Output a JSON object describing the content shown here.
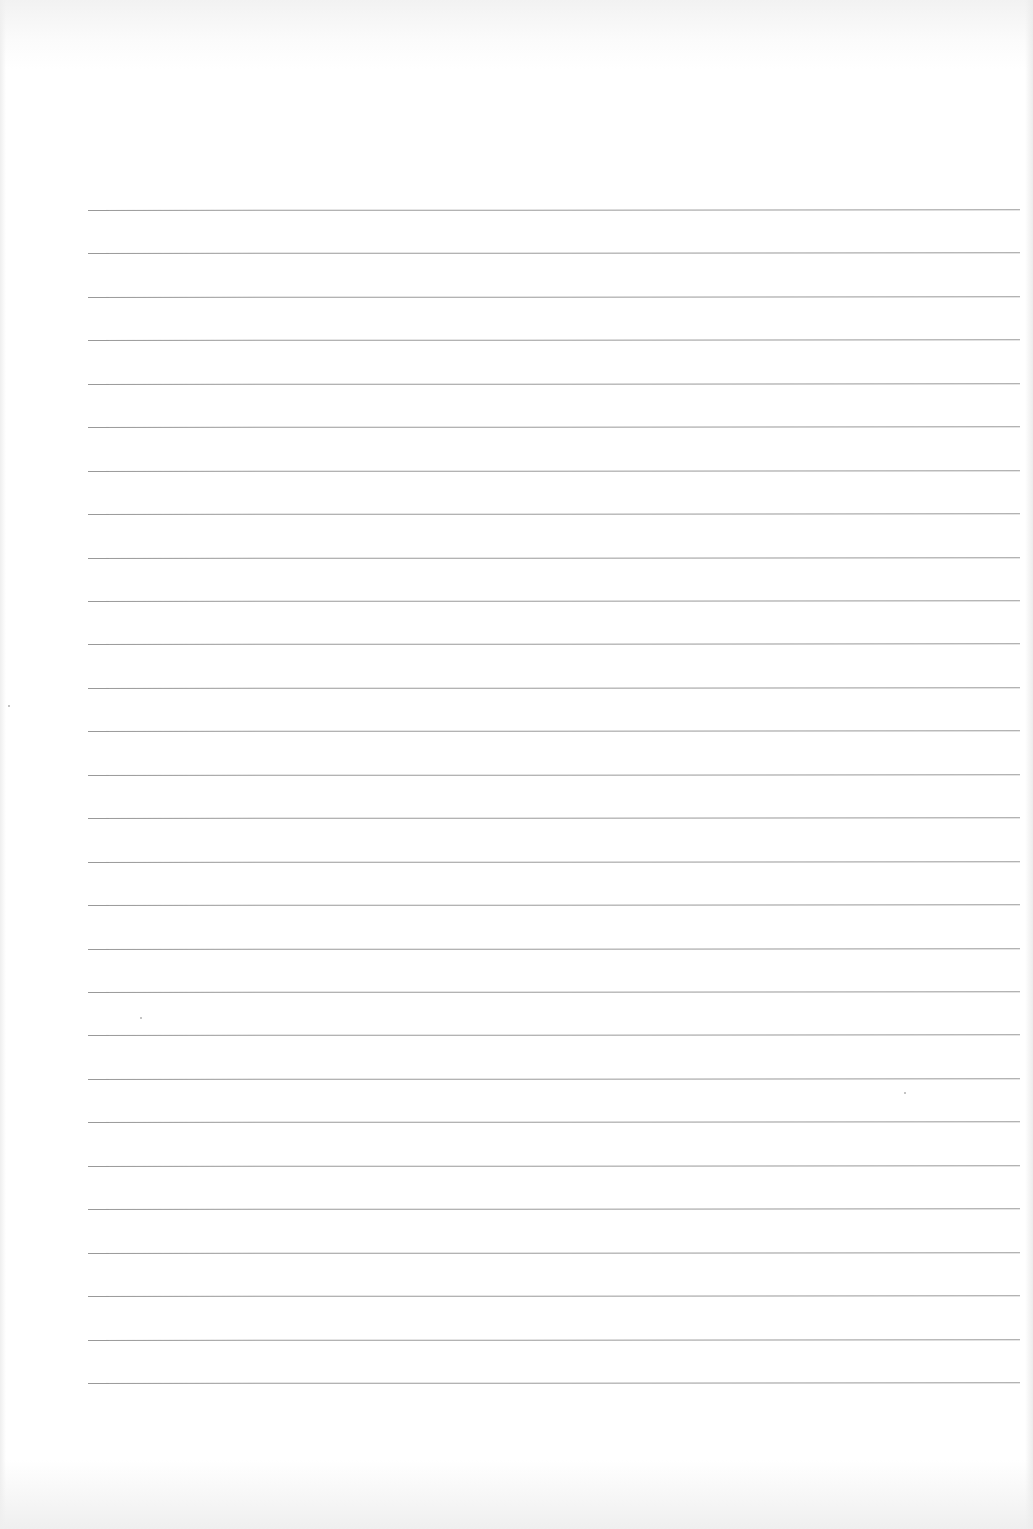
{
  "page": {
    "type": "blank-lined-paper",
    "background_color": "#ffffff",
    "line_color": "#8e8e8e",
    "line_count": 28,
    "line_left_x": 88,
    "line_right_x": 1020,
    "first_line_y": 210,
    "last_line_y": 1383,
    "line_spacing": 43.4,
    "line_tilt_deg": -0.05
  }
}
